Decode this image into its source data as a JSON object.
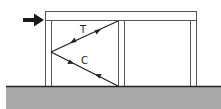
{
  "diagram": {
    "labels": {
      "tension": "T",
      "compression": "C"
    },
    "elements": {
      "load_arrow": "lateral-load-arrow",
      "beam": "top-beam",
      "columns": [
        "left-column",
        "middle-column",
        "right-column"
      ],
      "braces": [
        "tension-brace",
        "compression-brace"
      ],
      "ground": "ground"
    },
    "colors": {
      "line": "#3a3a3a",
      "ground_fill": "#a9a9a9",
      "ground_line": "#222222",
      "arrow": "#1a1a1a"
    }
  }
}
